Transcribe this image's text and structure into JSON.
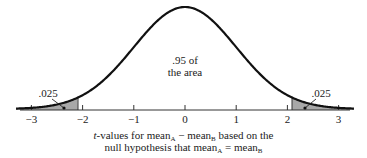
{
  "chart_data": {
    "type": "area",
    "title": "",
    "xlabel_line1": {
      "prefix_italic": "t",
      "text": "-values for mean",
      "sub1": "A",
      "mid": " − mean",
      "sub2": "B",
      "suffix": " based on the"
    },
    "xlabel_line2": {
      "text": "null hypothesis that mean",
      "sub1": "A",
      "mid": " = mean",
      "sub2": "B"
    },
    "x_ticks": [
      -3,
      -2,
      -1,
      0,
      1,
      2,
      3
    ],
    "x_tick_labels": [
      "−3",
      "−2",
      "−1",
      "0",
      "1",
      "2",
      "3"
    ],
    "xlim": [
      -3.3,
      3.3
    ],
    "critical_values": [
      -2.09,
      2.09
    ],
    "regions": [
      {
        "name": "left tail",
        "range": [
          -3.3,
          -2.09
        ],
        "area": 0.025,
        "label": ".025",
        "shaded": true
      },
      {
        "name": "center",
        "range": [
          -2.09,
          2.09
        ],
        "area": 0.95,
        "label": ".95 of the area",
        "shaded": false
      },
      {
        "name": "right tail",
        "range": [
          2.09,
          3.3
        ],
        "area": 0.025,
        "label": ".025",
        "shaded": true
      }
    ],
    "annotations": {
      "center_line1": ".95 of",
      "center_line2": "the area",
      "left_tail": ".025",
      "right_tail": ".025"
    },
    "grid": false,
    "legend": null,
    "colors": {
      "curve": "#111111",
      "shade": "#a8a8a8",
      "axis": "#333333"
    }
  }
}
